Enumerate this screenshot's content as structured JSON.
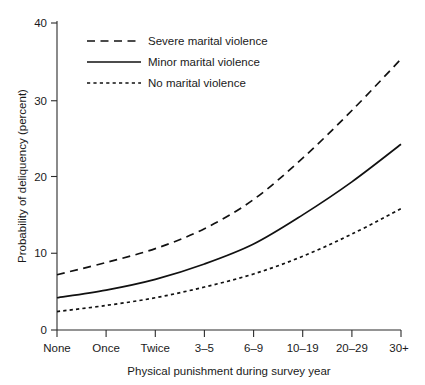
{
  "chart_data": {
    "type": "line",
    "title": "",
    "xlabel": "Physical punishment during survey year",
    "ylabel": "Probability of deliquency (percent)",
    "categories": [
      "None",
      "Once",
      "Twice",
      "3–5",
      "6–9",
      "10–19",
      "20–29",
      "30+"
    ],
    "ylim": [
      0,
      40
    ],
    "yticks": [
      0,
      10,
      20,
      30,
      40
    ],
    "ytick_labels": [
      "0",
      "10",
      "20",
      "30",
      "40"
    ],
    "grid": false,
    "legend_position": "upper left",
    "series": [
      {
        "name": "Severe marital violence",
        "style": "long-dash",
        "values": [
          7.2,
          8.8,
          10.6,
          13.2,
          17.0,
          22.4,
          28.6,
          35.3
        ]
      },
      {
        "name": "Minor marital violence",
        "style": "solid",
        "values": [
          4.2,
          5.2,
          6.6,
          8.6,
          11.2,
          15.0,
          19.3,
          24.2
        ]
      },
      {
        "name": "No marital violence",
        "style": "short-dash",
        "values": [
          2.4,
          3.2,
          4.2,
          5.6,
          7.3,
          9.6,
          12.5,
          15.8
        ]
      }
    ]
  },
  "axis": {
    "y_title": "Probability of deliquency (percent)",
    "x_title": "Physical punishment during survey year",
    "y_tick_0": "0",
    "y_tick_10": "10",
    "y_tick_20": "20",
    "y_tick_30": "30",
    "y_tick_40": "40",
    "x_tick_0": "None",
    "x_tick_1": "Once",
    "x_tick_2": "Twice",
    "x_tick_3": "3–5",
    "x_tick_4": "6–9",
    "x_tick_5": "10–19",
    "x_tick_6": "20–29",
    "x_tick_7": "30+"
  },
  "legend": {
    "entries": [
      {
        "label": "Severe marital violence",
        "style": "long-dash"
      },
      {
        "label": "Minor marital violence",
        "style": "solid"
      },
      {
        "label": "No marital violence",
        "style": "short-dash"
      }
    ]
  },
  "colors": {
    "line": "#111111",
    "axis": "#2b2b2b",
    "text": "#1a1a1a",
    "background": "#ffffff"
  }
}
